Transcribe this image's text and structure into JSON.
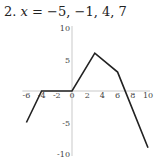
{
  "problem": {
    "number": "2.",
    "variable": "x",
    "equals": "=",
    "values": "−5, −1, 4, 7"
  },
  "chart_data": {
    "type": "line",
    "xlabel": "",
    "ylabel": "",
    "xlim": [
      -6,
      10
    ],
    "ylim": [
      -10,
      10
    ],
    "x_ticks": [
      -6,
      -4,
      -2,
      0,
      2,
      4,
      6,
      8,
      10
    ],
    "y_ticks": [
      10,
      5,
      -5,
      -10
    ],
    "x_tick_labels": [
      "-6",
      "-4",
      "-2",
      "0",
      "2",
      "4",
      "6",
      "8",
      "10"
    ],
    "y_tick_labels": [
      "10",
      "5",
      "-5",
      "-10"
    ],
    "grid": false,
    "series": [
      {
        "name": "f(x)",
        "x": [
          -6,
          -4,
          0,
          3,
          6,
          10
        ],
        "y": [
          -5,
          0,
          0,
          6,
          3,
          -9
        ]
      }
    ]
  }
}
